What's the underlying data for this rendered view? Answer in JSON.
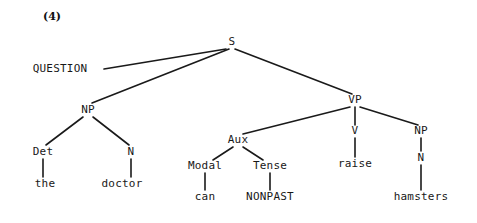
{
  "figure": {
    "example_number": "(4)",
    "example_number_pos": {
      "x": 52,
      "y": 16
    },
    "width": 477,
    "height": 223,
    "background_color": "#ffffff",
    "line_color": "#1a1a1a",
    "text_color": "#181818"
  },
  "tree": {
    "sentence": "the doctor can raise hamsters",
    "root": "S",
    "nodes": [
      {
        "id": "question",
        "label": "QUESTION",
        "kind": "feature",
        "x": 60,
        "y": 69
      },
      {
        "id": "s",
        "label": "S",
        "kind": "category",
        "x": 232,
        "y": 42
      },
      {
        "id": "np1",
        "label": "NP",
        "kind": "category",
        "x": 88,
        "y": 110
      },
      {
        "id": "det",
        "label": "Det",
        "kind": "category",
        "x": 43,
        "y": 152
      },
      {
        "id": "the",
        "label": "the",
        "kind": "terminal",
        "x": 45,
        "y": 184
      },
      {
        "id": "n1",
        "label": "N",
        "kind": "category",
        "x": 131,
        "y": 152
      },
      {
        "id": "doctor",
        "label": "doctor",
        "kind": "terminal",
        "x": 122,
        "y": 184
      },
      {
        "id": "vp",
        "label": "VP",
        "kind": "category",
        "x": 355,
        "y": 100
      },
      {
        "id": "aux",
        "label": "Aux",
        "kind": "category",
        "x": 238,
        "y": 140
      },
      {
        "id": "modal",
        "label": "Modal",
        "kind": "category",
        "x": 205,
        "y": 166
      },
      {
        "id": "can",
        "label": "can",
        "kind": "terminal",
        "x": 205,
        "y": 197
      },
      {
        "id": "tense",
        "label": "Tense",
        "kind": "category",
        "x": 270,
        "y": 166
      },
      {
        "id": "nonpast",
        "label": "NONPAST",
        "kind": "feature",
        "x": 270,
        "y": 197
      },
      {
        "id": "v",
        "label": "V",
        "kind": "category",
        "x": 355,
        "y": 131
      },
      {
        "id": "raise",
        "label": "raise",
        "kind": "terminal",
        "x": 355,
        "y": 164
      },
      {
        "id": "np2",
        "label": "NP",
        "kind": "category",
        "x": 421,
        "y": 131
      },
      {
        "id": "n2",
        "label": "N",
        "kind": "category",
        "x": 421,
        "y": 158
      },
      {
        "id": "hamsters",
        "label": "hamsters",
        "kind": "terminal",
        "x": 421,
        "y": 197
      }
    ],
    "edges": [
      {
        "from": "s",
        "to": "question",
        "x1": 226,
        "y1": 49,
        "x2": 104,
        "y2": 69
      },
      {
        "from": "s",
        "to": "np1",
        "x1": 229,
        "y1": 49,
        "x2": 92,
        "y2": 103
      },
      {
        "from": "s",
        "to": "vp",
        "x1": 235,
        "y1": 49,
        "x2": 352,
        "y2": 94
      },
      {
        "from": "np1",
        "to": "det",
        "x1": 83,
        "y1": 117,
        "x2": 46,
        "y2": 145
      },
      {
        "from": "np1",
        "to": "n1",
        "x1": 93,
        "y1": 117,
        "x2": 129,
        "y2": 145
      },
      {
        "from": "det",
        "to": "the",
        "x1": 43,
        "y1": 159,
        "x2": 43,
        "y2": 177
      },
      {
        "from": "n1",
        "to": "doctor",
        "x1": 131,
        "y1": 159,
        "x2": 131,
        "y2": 177
      },
      {
        "from": "vp",
        "to": "aux",
        "x1": 350,
        "y1": 107,
        "x2": 243,
        "y2": 134
      },
      {
        "from": "vp",
        "to": "v",
        "x1": 355,
        "y1": 107,
        "x2": 355,
        "y2": 125
      },
      {
        "from": "vp",
        "to": "np2",
        "x1": 360,
        "y1": 107,
        "x2": 418,
        "y2": 125
      },
      {
        "from": "aux",
        "to": "modal",
        "x1": 233,
        "y1": 147,
        "x2": 213,
        "y2": 160
      },
      {
        "from": "aux",
        "to": "tense",
        "x1": 243,
        "y1": 147,
        "x2": 263,
        "y2": 160
      },
      {
        "from": "modal",
        "to": "can",
        "x1": 205,
        "y1": 173,
        "x2": 205,
        "y2": 190
      },
      {
        "from": "tense",
        "to": "nonpast",
        "x1": 270,
        "y1": 173,
        "x2": 270,
        "y2": 190
      },
      {
        "from": "v",
        "to": "raise",
        "x1": 355,
        "y1": 138,
        "x2": 355,
        "y2": 157
      },
      {
        "from": "np2",
        "to": "n2",
        "x1": 421,
        "y1": 138,
        "x2": 421,
        "y2": 151
      },
      {
        "from": "n2",
        "to": "hamsters",
        "x1": 421,
        "y1": 165,
        "x2": 421,
        "y2": 190
      }
    ]
  }
}
